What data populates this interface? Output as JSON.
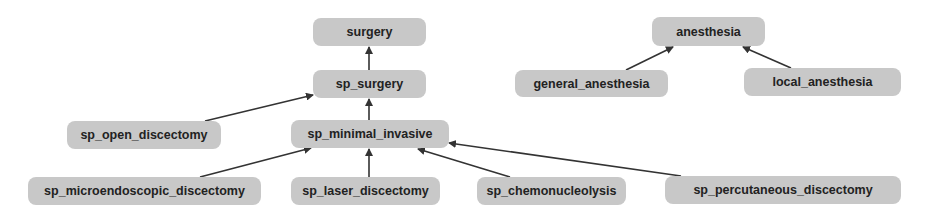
{
  "diagram": {
    "type": "hierarchy",
    "colors": {
      "node_fill": "#c8c8c8",
      "node_text": "#222222",
      "edge": "#333333",
      "background": "#ffffff"
    },
    "nodes": [
      {
        "id": "surgery",
        "label": "surgery",
        "x": 313,
        "y": 18,
        "w": 113,
        "h": 28
      },
      {
        "id": "sp_surgery",
        "label": "sp_surgery",
        "x": 313,
        "y": 70,
        "w": 113,
        "h": 28
      },
      {
        "id": "anesthesia",
        "label": "anesthesia",
        "x": 652,
        "y": 17,
        "w": 113,
        "h": 29
      },
      {
        "id": "general_anesthesia",
        "label": "general_anesthesia",
        "x": 515,
        "y": 70,
        "w": 153,
        "h": 27
      },
      {
        "id": "local_anesthesia",
        "label": "local_anesthesia",
        "x": 744,
        "y": 68,
        "w": 157,
        "h": 28
      },
      {
        "id": "sp_open_discectomy",
        "label": "sp_open_discectomy",
        "x": 67,
        "y": 121,
        "w": 154,
        "h": 28
      },
      {
        "id": "sp_minimal_invasive",
        "label": "sp_minimal_invasive",
        "x": 291,
        "y": 120,
        "w": 158,
        "h": 28
      },
      {
        "id": "sp_microendoscopic_discectomy",
        "label": "sp_microendoscopic_discectomy",
        "x": 28,
        "y": 177,
        "w": 233,
        "h": 28
      },
      {
        "id": "sp_laser_discectomy",
        "label": "sp_laser_discectomy",
        "x": 291,
        "y": 177,
        "w": 149,
        "h": 28
      },
      {
        "id": "sp_chemonucleolysis",
        "label": "sp_chemonucleolysis",
        "x": 477,
        "y": 177,
        "w": 149,
        "h": 28
      },
      {
        "id": "sp_percutaneous_discectomy",
        "label": "sp_percutaneous_discectomy",
        "x": 665,
        "y": 176,
        "w": 236,
        "h": 28
      }
    ],
    "edges": [
      {
        "from": "sp_surgery",
        "to": "surgery",
        "x1": 369,
        "y1": 70,
        "x2": 369,
        "y2": 47
      },
      {
        "from": "sp_open_discectomy",
        "to": "sp_surgery",
        "x1": 205,
        "y1": 121,
        "x2": 313,
        "y2": 95
      },
      {
        "from": "sp_minimal_invasive",
        "to": "sp_surgery",
        "x1": 369,
        "y1": 120,
        "x2": 369,
        "y2": 99
      },
      {
        "from": "general_anesthesia",
        "to": "anesthesia",
        "x1": 626,
        "y1": 70,
        "x2": 673,
        "y2": 47
      },
      {
        "from": "local_anesthesia",
        "to": "anesthesia",
        "x1": 791,
        "y1": 68,
        "x2": 743,
        "y2": 47
      },
      {
        "from": "sp_microendoscopic_discectomy",
        "to": "sp_minimal_invasive",
        "x1": 200,
        "y1": 177,
        "x2": 311,
        "y2": 148
      },
      {
        "from": "sp_laser_discectomy",
        "to": "sp_minimal_invasive",
        "x1": 369,
        "y1": 177,
        "x2": 369,
        "y2": 149
      },
      {
        "from": "sp_chemonucleolysis",
        "to": "sp_minimal_invasive",
        "x1": 510,
        "y1": 177,
        "x2": 418,
        "y2": 149
      },
      {
        "from": "sp_percutaneous_discectomy",
        "to": "sp_minimal_invasive",
        "x1": 681,
        "y1": 176,
        "x2": 449,
        "y2": 143
      }
    ]
  }
}
